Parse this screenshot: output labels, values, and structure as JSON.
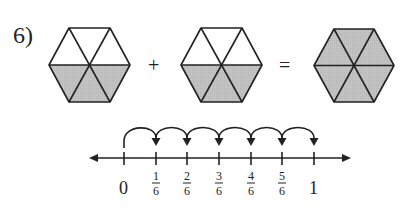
{
  "problem": {
    "number_label": "6)",
    "operator_plus": "+",
    "operator_equals": "="
  },
  "hexagons": [
    {
      "name": "addend-1",
      "shaded_parts": 3,
      "total_parts": 6
    },
    {
      "name": "addend-2",
      "shaded_parts": 3,
      "total_parts": 6
    },
    {
      "name": "sum",
      "shaded_parts": 6,
      "total_parts": 6
    }
  ],
  "colors": {
    "shade": "#c4c4c4",
    "stroke": "#222222",
    "background": "#ffffff"
  },
  "number_line": {
    "ticks": [
      {
        "label": "0"
      },
      {
        "num": "1",
        "den": "6"
      },
      {
        "num": "2",
        "den": "6"
      },
      {
        "num": "3",
        "den": "6"
      },
      {
        "num": "4",
        "den": "6"
      },
      {
        "num": "5",
        "den": "6"
      },
      {
        "label": "1"
      }
    ],
    "jumps": 6
  }
}
